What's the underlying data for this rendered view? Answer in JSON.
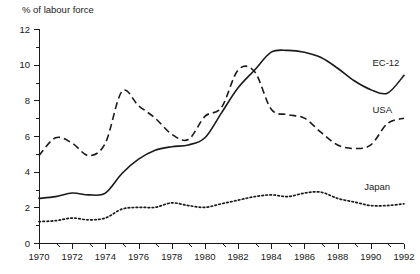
{
  "chart_data": {
    "type": "line",
    "title": "",
    "subtitle": "",
    "ylabel": "% of labour force",
    "xlabel": "",
    "xlim": [
      1970,
      1992
    ],
    "ylim": [
      0,
      12
    ],
    "y_ticks_major": [
      0,
      2,
      4,
      6,
      8,
      10,
      12
    ],
    "y_ticks_minor": [
      1,
      3,
      5,
      7,
      9,
      11
    ],
    "x_ticks_major": [
      1970,
      1972,
      1974,
      1976,
      1978,
      1980,
      1982,
      1984,
      1986,
      1988,
      1990,
      1992
    ],
    "x_ticks_minor": [
      1971,
      1973,
      1975,
      1977,
      1979,
      1981,
      1983,
      1985,
      1987,
      1989,
      1991
    ],
    "x_tick_labels": [
      "1970",
      "1972",
      "1974",
      "1976",
      "1978",
      "1980",
      "1982",
      "1984",
      "1986",
      "1988",
      "1990",
      "1992"
    ],
    "y_tick_labels": [
      "0",
      "2",
      "4",
      "6",
      "8",
      "10",
      "12"
    ],
    "grid": false,
    "legend_position": "inline-right",
    "x": [
      1970,
      1971,
      1972,
      1973,
      1974,
      1975,
      1976,
      1977,
      1978,
      1979,
      1980,
      1981,
      1982,
      1983,
      1984,
      1985,
      1986,
      1987,
      1988,
      1989,
      1990,
      1991,
      1992
    ],
    "series": [
      {
        "name": "EC-12",
        "style": "solid",
        "color": "#1a1a1a",
        "label_x": 1990.1,
        "label_y": 9.9,
        "values": [
          2.5,
          2.6,
          2.8,
          2.7,
          2.8,
          3.9,
          4.7,
          5.2,
          5.4,
          5.5,
          5.9,
          7.3,
          8.7,
          9.7,
          10.7,
          10.8,
          10.7,
          10.4,
          9.8,
          9.1,
          8.6,
          8.4,
          9.4
        ]
      },
      {
        "name": "USA",
        "style": "dashed",
        "color": "#1a1a1a",
        "label_x": 1990.1,
        "label_y": 7.3,
        "values": [
          4.9,
          5.9,
          5.6,
          4.9,
          5.6,
          8.5,
          7.7,
          7.0,
          6.1,
          5.8,
          7.1,
          7.6,
          9.7,
          9.6,
          7.5,
          7.2,
          7.0,
          6.2,
          5.5,
          5.3,
          5.5,
          6.7,
          7.0
        ]
      },
      {
        "name": "Japan",
        "style": "dotted",
        "color": "#1a1a1a",
        "label_x": 1989.6,
        "label_y": 3.0,
        "values": [
          1.2,
          1.25,
          1.4,
          1.3,
          1.4,
          1.9,
          2.0,
          2.0,
          2.25,
          2.1,
          2.0,
          2.2,
          2.4,
          2.6,
          2.7,
          2.6,
          2.8,
          2.85,
          2.5,
          2.3,
          2.1,
          2.1,
          2.2
        ]
      }
    ]
  }
}
